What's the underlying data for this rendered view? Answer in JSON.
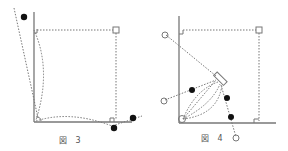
{
  "figures": [
    {
      "id": "fig3",
      "caption": "図 3"
    },
    {
      "id": "fig4",
      "caption": "図 4"
    }
  ],
  "colors": {
    "line": "#666666",
    "dot": "#111111",
    "hollow": "#777777",
    "bg": "#ffffff"
  }
}
